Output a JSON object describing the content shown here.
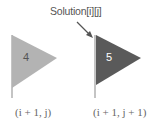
{
  "annotation": {
    "label": "Solution[i][j]",
    "arrow_target": "right-flag"
  },
  "flags": [
    {
      "value": "4",
      "coord_label": "(i + 1, j)",
      "fill": "#b3b3b3",
      "text_color": "#555555"
    },
    {
      "value": "5",
      "coord_label": "(i + 1, j + 1)",
      "fill": "#5a5a5a",
      "text_color": "#ffffff"
    }
  ],
  "colors": {
    "pole": "#c4c4c4",
    "arrow": "#555555"
  }
}
